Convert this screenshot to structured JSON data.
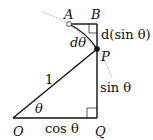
{
  "diagram": {
    "type": "geometry",
    "points": {
      "O": {
        "label": "O",
        "x": 13,
        "y": 118
      },
      "Q": {
        "label": "Q",
        "x": 97,
        "y": 118
      },
      "P": {
        "label": "P",
        "x": 97,
        "y": 49
      },
      "A": {
        "label": "A",
        "x": 69,
        "y": 24
      },
      "B": {
        "label": "B",
        "x": 97,
        "y": 24
      }
    },
    "labels": {
      "hyp": "1",
      "theta": "θ",
      "cos": "cos θ",
      "sin": "sin θ",
      "dtheta": "dθ",
      "dsin": "d(sin θ)"
    },
    "colors": {
      "line": "#111111",
      "arc": "#999999"
    }
  }
}
